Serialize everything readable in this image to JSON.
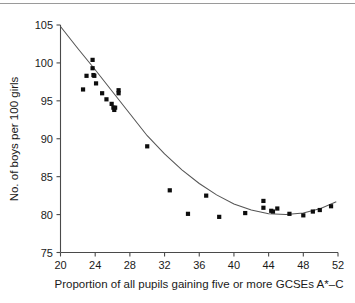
{
  "chart_data": {
    "type": "scatter",
    "title": "",
    "xlabel": "Proportion of all pupils gaining five or more GCSEs A*–C",
    "ylabel": "No. of boys per 100 girls",
    "xlim": [
      20,
      52
    ],
    "ylim": [
      75,
      105
    ],
    "xticks": [
      20,
      24,
      28,
      32,
      36,
      40,
      44,
      48,
      52
    ],
    "yticks": [
      75,
      80,
      85,
      90,
      95,
      100,
      105
    ],
    "xtick_labels": [
      "20",
      "24",
      "28",
      "32",
      "36",
      "40",
      "44",
      "48",
      "52"
    ],
    "ytick_labels": [
      "75",
      "80",
      "85",
      "90",
      "95",
      "100",
      "105"
    ],
    "grid": false,
    "legend": false,
    "marker": "square",
    "marker_color": "#0d0d0d",
    "points": [
      {
        "x": 22.6,
        "y": 96.5
      },
      {
        "x": 23.0,
        "y": 98.3
      },
      {
        "x": 23.7,
        "y": 100.4
      },
      {
        "x": 23.7,
        "y": 99.3
      },
      {
        "x": 23.8,
        "y": 98.4
      },
      {
        "x": 23.9,
        "y": 98.3
      },
      {
        "x": 24.1,
        "y": 97.3
      },
      {
        "x": 24.8,
        "y": 96.0
      },
      {
        "x": 25.3,
        "y": 95.2
      },
      {
        "x": 25.9,
        "y": 94.6
      },
      {
        "x": 26.1,
        "y": 94.1
      },
      {
        "x": 26.2,
        "y": 93.8
      },
      {
        "x": 26.3,
        "y": 94.1
      },
      {
        "x": 26.7,
        "y": 96.4
      },
      {
        "x": 26.7,
        "y": 96.0
      },
      {
        "x": 30.0,
        "y": 89.0
      },
      {
        "x": 32.6,
        "y": 83.2
      },
      {
        "x": 34.7,
        "y": 80.1
      },
      {
        "x": 36.8,
        "y": 82.5
      },
      {
        "x": 38.3,
        "y": 79.7
      },
      {
        "x": 41.3,
        "y": 80.2
      },
      {
        "x": 43.4,
        "y": 81.8
      },
      {
        "x": 43.4,
        "y": 80.9
      },
      {
        "x": 44.3,
        "y": 80.5
      },
      {
        "x": 44.5,
        "y": 80.4
      },
      {
        "x": 45.0,
        "y": 80.8
      },
      {
        "x": 46.4,
        "y": 80.1
      },
      {
        "x": 48.0,
        "y": 79.9
      },
      {
        "x": 49.1,
        "y": 80.4
      },
      {
        "x": 49.9,
        "y": 80.6
      },
      {
        "x": 51.2,
        "y": 81.1
      }
    ],
    "fit_curve": {
      "description": "quadratic trend line",
      "points": [
        {
          "x": 20.0,
          "y": 104.8
        },
        {
          "x": 22.0,
          "y": 101.9
        },
        {
          "x": 24.0,
          "y": 99.1
        },
        {
          "x": 26.0,
          "y": 96.2
        },
        {
          "x": 28.0,
          "y": 93.3
        },
        {
          "x": 30.0,
          "y": 90.4
        },
        {
          "x": 32.0,
          "y": 88.0
        },
        {
          "x": 34.0,
          "y": 85.9
        },
        {
          "x": 36.0,
          "y": 84.1
        },
        {
          "x": 38.0,
          "y": 82.6
        },
        {
          "x": 40.0,
          "y": 81.4
        },
        {
          "x": 42.0,
          "y": 80.6
        },
        {
          "x": 44.0,
          "y": 80.1
        },
        {
          "x": 46.0,
          "y": 80.0
        },
        {
          "x": 48.0,
          "y": 80.2
        },
        {
          "x": 50.0,
          "y": 80.8
        },
        {
          "x": 51.8,
          "y": 81.7
        }
      ]
    }
  },
  "figure": {
    "top_rule_color": "#9a9a9a",
    "axis_color": "#4a4a4a",
    "curve_color": "#555555",
    "background": "#ffffff"
  }
}
